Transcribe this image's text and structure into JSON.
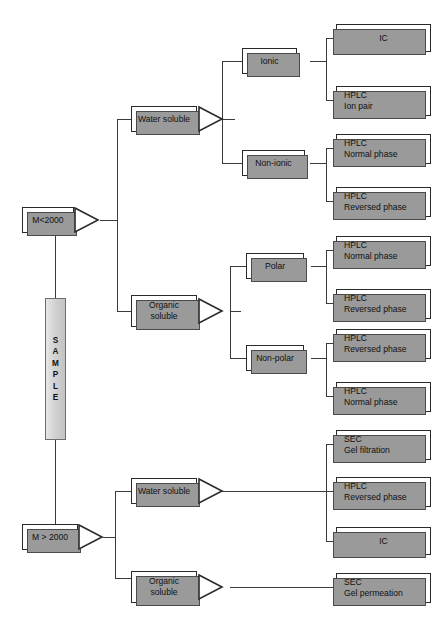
{
  "diagram": {
    "root": {
      "label": "SAMPLE",
      "letters": [
        "S",
        "A",
        "M",
        "P",
        "L",
        "E"
      ]
    },
    "colors": {
      "box_fill": "#ffffff",
      "box_border": "#2a2a2a",
      "shadow": "#9a9a9a",
      "line": "#3a3a3a",
      "sample_fill": "#d2d2d2",
      "text": "#111111"
    },
    "branches": [
      {
        "id": "mw-low",
        "label": "M<2000",
        "children": [
          {
            "id": "water-soluble-low",
            "label": "Water soluble",
            "children": [
              {
                "id": "ionic",
                "label": "Ionic",
                "methods": [
                  {
                    "lines": [
                      "IC"
                    ],
                    "align": "center"
                  },
                  {
                    "lines": [
                      "HPLC",
                      "Ion pair"
                    ],
                    "align": "left"
                  }
                ]
              },
              {
                "id": "non-ionic",
                "label": "Non-ionic",
                "methods": [
                  {
                    "lines": [
                      "HPLC",
                      "Normal phase"
                    ],
                    "align": "left"
                  },
                  {
                    "lines": [
                      "HPLC",
                      "Reversed phase"
                    ],
                    "align": "left"
                  }
                ]
              }
            ]
          },
          {
            "id": "organic-soluble-low",
            "label": "Organic soluble",
            "label_lines": [
              "Organic",
              "soluble"
            ],
            "children": [
              {
                "id": "polar",
                "label": "Polar",
                "methods": [
                  {
                    "lines": [
                      "HPLC",
                      "Normal phase"
                    ],
                    "align": "left"
                  },
                  {
                    "lines": [
                      "HPLC",
                      "Reversed phase"
                    ],
                    "align": "left"
                  }
                ]
              },
              {
                "id": "non-polar",
                "label": "Non-polar",
                "methods": [
                  {
                    "lines": [
                      "HPLC",
                      "Reversed phase"
                    ],
                    "align": "left"
                  },
                  {
                    "lines": [
                      "HPLC",
                      "Normal phase"
                    ],
                    "align": "left"
                  }
                ]
              }
            ]
          }
        ]
      },
      {
        "id": "mw-high",
        "label": "M > 2000",
        "children": [
          {
            "id": "water-soluble-high",
            "label": "Water soluble",
            "methods": [
              {
                "lines": [
                  "SEC",
                  "Gel filtration"
                ],
                "align": "left"
              },
              {
                "lines": [
                  "HPLC",
                  "Reversed phase"
                ],
                "align": "left"
              },
              {
                "lines": [
                  "IC"
                ],
                "align": "center"
              }
            ]
          },
          {
            "id": "organic-soluble-high",
            "label": "Organic soluble",
            "label_lines": [
              "Organic",
              "soluble"
            ],
            "methods": [
              {
                "lines": [
                  "SEC",
                  "Gel permeation"
                ],
                "align": "left"
              }
            ]
          }
        ]
      }
    ],
    "nodes": {
      "mw_low": "M<2000",
      "mw_high": "M > 2000",
      "water_soluble": "Water soluble",
      "organic_1": "Organic",
      "organic_2": "soluble",
      "ionic": "Ionic",
      "non_ionic": "Non-ionic",
      "polar": "Polar",
      "non_polar": "Non-polar"
    },
    "leaves": {
      "ic_top": "IC",
      "hplc_1a": "HPLC",
      "hplc_1b": "Ion pair",
      "hplc_2a": "HPLC",
      "hplc_2b": "Normal phase",
      "hplc_3a": "HPLC",
      "hplc_3b": "Reversed phase",
      "hplc_4a": "HPLC",
      "hplc_4b": "Normal phase",
      "hplc_5a": "HPLC",
      "hplc_5b": "Reversed phase",
      "hplc_6a": "HPLC",
      "hplc_6b": "Reversed phase",
      "hplc_7a": "HPLC",
      "hplc_7b": "Normal phase",
      "sec_1a": "SEC",
      "sec_1b": "Gel filtration",
      "hplc_8a": "HPLC",
      "hplc_8b": "Reversed phase",
      "ic_bottom": "IC",
      "sec_2a": "SEC",
      "sec_2b": "Gel permeation"
    }
  }
}
